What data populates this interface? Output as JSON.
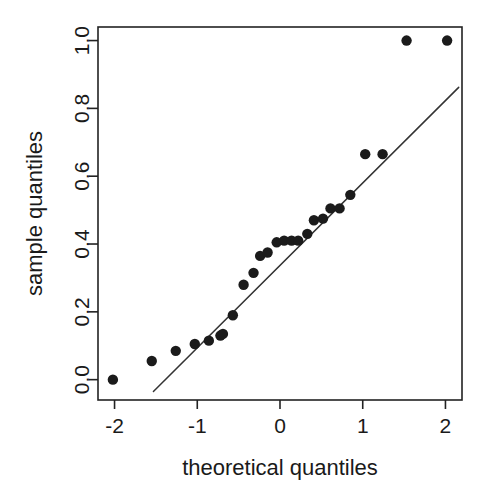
{
  "chart_data": {
    "type": "scatter",
    "title": "",
    "subtitle": "",
    "xlabel": "theoretical quantiles",
    "ylabel": "sample quantiles",
    "xlim": [
      -2.2,
      2.2
    ],
    "ylim": [
      -0.06,
      1.04
    ],
    "xticks": [
      -2,
      -1,
      0,
      1,
      2
    ],
    "xticklabels": [
      "-2",
      "-1",
      "0",
      "1",
      "2"
    ],
    "yticks": [
      0.0,
      0.2,
      0.4,
      0.6,
      0.8,
      1.0
    ],
    "yticklabels": [
      "0.0",
      "0.2",
      "0.4",
      "0.6",
      "0.8",
      "1.0"
    ],
    "grid": false,
    "legend": false,
    "legend_position": "none",
    "frame": "box",
    "marker": "filled-circle",
    "marker_color": "#1b1b1b",
    "marker_size": 5.2,
    "x": [
      -2.02,
      -1.55,
      -1.26,
      -1.03,
      -0.86,
      -0.72,
      -0.69,
      -0.57,
      -0.44,
      -0.32,
      -0.24,
      -0.15,
      -0.04,
      0.05,
      0.14,
      0.22,
      0.33,
      0.41,
      0.52,
      0.61,
      0.72,
      0.85,
      1.03,
      1.24,
      1.53,
      2.02
    ],
    "y": [
      0.0,
      0.055,
      0.085,
      0.105,
      0.115,
      0.13,
      0.135,
      0.19,
      0.28,
      0.315,
      0.365,
      0.375,
      0.405,
      0.41,
      0.41,
      0.41,
      0.43,
      0.47,
      0.475,
      0.505,
      0.505,
      0.545,
      0.665,
      0.665,
      1.0,
      1.0
    ],
    "series": [
      {
        "name": "sample vs theoretical quantiles",
        "points": [
          {
            "x": -2.02,
            "y": 0.0
          },
          {
            "x": -1.55,
            "y": 0.055
          },
          {
            "x": -1.26,
            "y": 0.085
          },
          {
            "x": -1.03,
            "y": 0.105
          },
          {
            "x": -0.86,
            "y": 0.115
          },
          {
            "x": -0.72,
            "y": 0.13
          },
          {
            "x": -0.69,
            "y": 0.135
          },
          {
            "x": -0.57,
            "y": 0.19
          },
          {
            "x": -0.44,
            "y": 0.28
          },
          {
            "x": -0.32,
            "y": 0.315
          },
          {
            "x": -0.24,
            "y": 0.365
          },
          {
            "x": -0.15,
            "y": 0.375
          },
          {
            "x": -0.04,
            "y": 0.405
          },
          {
            "x": 0.05,
            "y": 0.41
          },
          {
            "x": 0.14,
            "y": 0.41
          },
          {
            "x": 0.22,
            "y": 0.41
          },
          {
            "x": 0.33,
            "y": 0.43
          },
          {
            "x": 0.41,
            "y": 0.47
          },
          {
            "x": 0.52,
            "y": 0.475
          },
          {
            "x": 0.61,
            "y": 0.505
          },
          {
            "x": 0.72,
            "y": 0.505
          },
          {
            "x": 0.85,
            "y": 0.545
          },
          {
            "x": 1.03,
            "y": 0.665
          },
          {
            "x": 1.24,
            "y": 0.665
          },
          {
            "x": 1.53,
            "y": 1.0
          },
          {
            "x": 2.02,
            "y": 1.0
          }
        ]
      }
    ],
    "reference_line": {
      "name": "qq-reference-line",
      "x1": -1.53,
      "y1": -0.035,
      "x2": 2.16,
      "y2": 0.862,
      "color": "#333333"
    }
  }
}
